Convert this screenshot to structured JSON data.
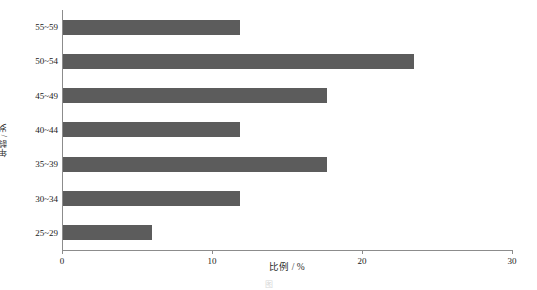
{
  "chart_data": {
    "type": "bar",
    "orientation": "horizontal",
    "title": "",
    "xlabel": "比例 / %",
    "ylabel": "年龄 / 岁",
    "categories": [
      "25~29",
      "30~34",
      "35~39",
      "40~44",
      "45~49",
      "50~54",
      "55~59"
    ],
    "values": [
      5.9,
      11.8,
      17.6,
      11.8,
      17.6,
      23.4,
      11.8
    ],
    "series": [
      {
        "name": "比例",
        "values": [
          5.9,
          11.8,
          17.6,
          11.8,
          17.6,
          23.4,
          11.8
        ]
      }
    ],
    "xlim": [
      0,
      30
    ],
    "xticks": [
      0,
      10,
      20,
      30
    ],
    "xtick_labels": [
      "0",
      "10",
      "20",
      "30"
    ],
    "grid": false,
    "legend": false,
    "bar_color": "#5c5c5c",
    "axis_color": "#8c8c8c",
    "background_color": "#ffffff"
  },
  "caption": {
    "text": "图"
  }
}
